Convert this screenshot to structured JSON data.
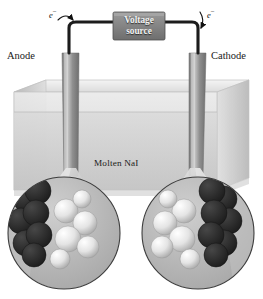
{
  "figure": {
    "background_color": "#ffffff"
  },
  "circuit": {
    "voltage_source": {
      "line1": "Voltage",
      "line2": "source",
      "box_color": "#8c8c8c",
      "text_color": "#f2f2f2"
    },
    "wire_color": "#1c1c1c",
    "electron_left": {
      "symbol": "e",
      "charge": "−",
      "direction": "away-from-anode"
    },
    "electron_right": {
      "symbol": "e",
      "charge": "−",
      "direction": "toward-cathode"
    }
  },
  "electrodes": {
    "anode": {
      "label": "Anode",
      "side": "left",
      "color": "#8e8e8e"
    },
    "cathode": {
      "label": "Cathode",
      "side": "right",
      "color": "#8e8e8e"
    }
  },
  "cell": {
    "electrolyte_label": "Molten NaI",
    "container_color": "#d3d3d3",
    "liquid_color": "#c9c9c9"
  },
  "magnifiers": [
    {
      "id": "anode-magnifier",
      "side": "left",
      "electrode_sphere_color": "#3a3a3a",
      "ion_sphere_color": "#f0f0f0",
      "background_color": "#b9b9b9",
      "spheres": [
        {
          "kind": "electrode",
          "cx": 18,
          "cy": 22,
          "r": 13
        },
        {
          "kind": "electrode",
          "cx": 13,
          "cy": 44,
          "r": 13
        },
        {
          "kind": "electrode",
          "cx": 18,
          "cy": 66,
          "r": 13
        },
        {
          "kind": "electrode",
          "cx": 30,
          "cy": 14,
          "r": 13
        },
        {
          "kind": "electrode",
          "cx": 28,
          "cy": 36,
          "r": 13
        },
        {
          "kind": "electrode",
          "cx": 31,
          "cy": 58,
          "r": 13
        },
        {
          "kind": "electrode",
          "cx": 26,
          "cy": 78,
          "r": 12
        },
        {
          "kind": "ion",
          "cx": 58,
          "cy": 34,
          "r": 12
        },
        {
          "kind": "ion",
          "cx": 74,
          "cy": 22,
          "r": 9
        },
        {
          "kind": "ion",
          "cx": 77,
          "cy": 46,
          "r": 12
        },
        {
          "kind": "ion",
          "cx": 60,
          "cy": 62,
          "r": 13
        },
        {
          "kind": "ion",
          "cx": 80,
          "cy": 70,
          "r": 11
        },
        {
          "kind": "ion",
          "cx": 52,
          "cy": 82,
          "r": 10
        }
      ]
    },
    {
      "id": "cathode-magnifier",
      "side": "right",
      "electrode_sphere_color": "#3a3a3a",
      "ion_sphere_color": "#f0f0f0",
      "background_color": "#b9b9b9",
      "spheres": [
        {
          "kind": "electrode",
          "cx": 82,
          "cy": 22,
          "r": 13
        },
        {
          "kind": "electrode",
          "cx": 87,
          "cy": 44,
          "r": 13
        },
        {
          "kind": "electrode",
          "cx": 82,
          "cy": 66,
          "r": 13
        },
        {
          "kind": "electrode",
          "cx": 70,
          "cy": 14,
          "r": 13
        },
        {
          "kind": "electrode",
          "cx": 72,
          "cy": 36,
          "r": 13
        },
        {
          "kind": "electrode",
          "cx": 69,
          "cy": 58,
          "r": 13
        },
        {
          "kind": "electrode",
          "cx": 74,
          "cy": 78,
          "r": 12
        },
        {
          "kind": "ion",
          "cx": 42,
          "cy": 34,
          "r": 12
        },
        {
          "kind": "ion",
          "cx": 26,
          "cy": 22,
          "r": 9
        },
        {
          "kind": "ion",
          "cx": 23,
          "cy": 46,
          "r": 12
        },
        {
          "kind": "ion",
          "cx": 40,
          "cy": 62,
          "r": 13
        },
        {
          "kind": "ion",
          "cx": 20,
          "cy": 70,
          "r": 11
        },
        {
          "kind": "ion",
          "cx": 48,
          "cy": 82,
          "r": 10
        }
      ]
    }
  ]
}
